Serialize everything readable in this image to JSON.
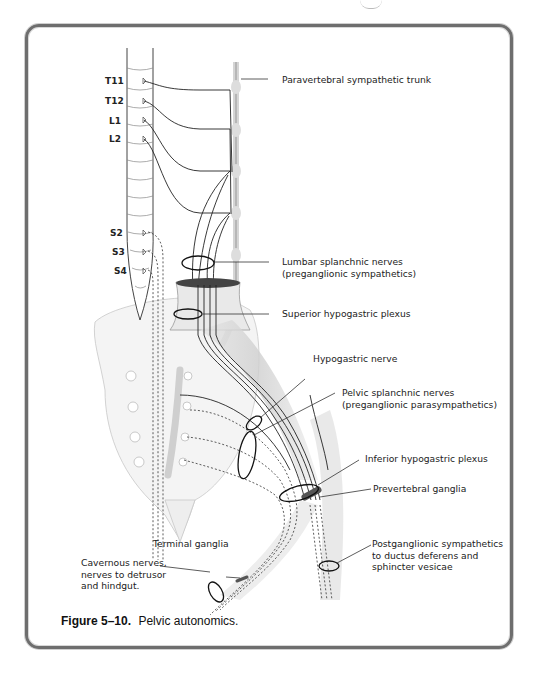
{
  "figure": {
    "number": "Figure 5–10.",
    "title": "Pelvic autonomics."
  },
  "spinal_segments": [
    {
      "label": "T11"
    },
    {
      "label": "T12"
    },
    {
      "label": "L1"
    },
    {
      "label": "L2"
    },
    {
      "label": "S2"
    },
    {
      "label": "S3"
    },
    {
      "label": "S4"
    }
  ],
  "labels": {
    "paravertebral_trunk": "Paravertebral sympathetic trunk",
    "lumbar_splanchnic_1": "Lumbar splanchnic nerves",
    "lumbar_splanchnic_2": "(preganglionic sympathetics)",
    "superior_hypogastric": "Superior hypogastric plexus",
    "hypogastric_nerve": "Hypogastric nerve",
    "pelvic_splanchnic_1": "Pelvic splanchnic nerves",
    "pelvic_splanchnic_2": "(preganglionic parasympathetics)",
    "inferior_hypogastric": "Inferior hypogastric plexus",
    "prevertebral_ganglia": "Prevertebral ganglia",
    "postganglionic_1": "Postganglionic sympathetics",
    "postganglionic_2": "to ductus deferens and",
    "postganglionic_3": "sphincter vesicae",
    "terminal_ganglia": "Terminal ganglia",
    "cavernous_1": "Cavernous nerves,",
    "cavernous_2": "nerves to detrusor",
    "cavernous_3": "and hindgut."
  },
  "colors": {
    "frame": "#6e6e6e",
    "line": "#2a2a2a",
    "bone": "#f2f2f2",
    "nerve_shade": "#d9d9d9"
  }
}
